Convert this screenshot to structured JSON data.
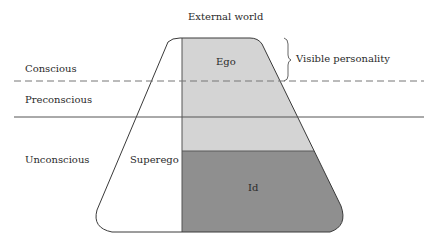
{
  "diagram": {
    "title": "External world",
    "levels": [
      {
        "id": "conscious",
        "label": "Conscious"
      },
      {
        "id": "preconscious",
        "label": "Preconscious"
      },
      {
        "id": "unconscious",
        "label": "Unconscious"
      }
    ],
    "regions": [
      {
        "id": "ego",
        "label": "Ego",
        "fill": "#d4d4d4"
      },
      {
        "id": "superego",
        "label": "Superego",
        "fill": "#ffffff"
      },
      {
        "id": "id",
        "label": "Id",
        "fill": "#8f8f8f"
      }
    ],
    "annotation": {
      "label": "Visible personality"
    },
    "colors": {
      "stroke": "#3a3a3a",
      "line": "#555555",
      "dashed": "#777777"
    }
  }
}
